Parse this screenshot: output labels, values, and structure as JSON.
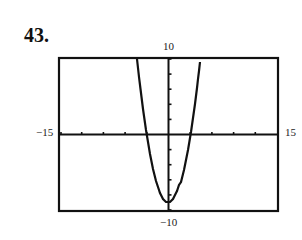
{
  "problem": {
    "number": "43."
  },
  "window": {
    "xmin_label": "−15",
    "xmax_label": "15",
    "ymin_label": "−10",
    "ymax_label": "10"
  },
  "chart_data": {
    "type": "line",
    "title": "",
    "xlabel": "",
    "ylabel": "",
    "xlim": [
      -15,
      15
    ],
    "ylim": [
      -10,
      10
    ],
    "xscale_tick": 3,
    "yscale_tick": 2,
    "grid": false,
    "legend": null,
    "annotations": [
      "43.",
      "10",
      "−10",
      "−15",
      "15"
    ],
    "series": [
      {
        "name": "y = x^2 - 9",
        "x": [
          -4.36,
          -4,
          -3.5,
          -3,
          -2.5,
          -2,
          -1.5,
          -1,
          -0.5,
          0,
          0.5,
          1,
          1.5,
          2,
          2.5,
          3,
          3.5,
          4,
          4.36
        ],
        "y": [
          10,
          7,
          3.25,
          0,
          -2.75,
          -5,
          -6.75,
          -8,
          -8.75,
          -9,
          -8.75,
          -8,
          -6.75,
          -5,
          -2.75,
          0,
          3.25,
          7,
          10
        ]
      }
    ]
  }
}
